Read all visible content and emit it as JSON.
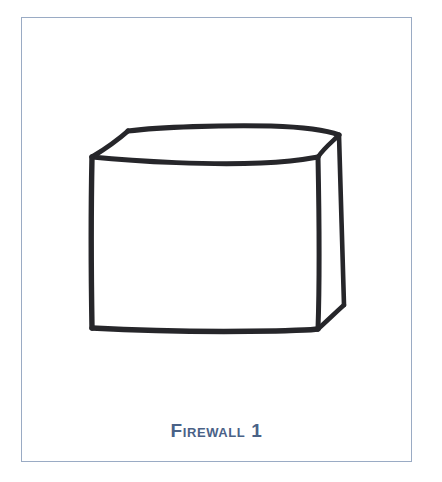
{
  "figure": {
    "caption": "Firewall 1",
    "diagram": {
      "kind": "hand-drawn-box",
      "subject": "firewall appliance",
      "description": "Hand sketched three dimensional rectangular box shown in perspective with visible front face, top face and narrow right side face"
    }
  },
  "colors": {
    "frame_border": "#9aabc4",
    "caption_text": "#4a6287",
    "sketch_ink": "#26262a",
    "page_background": "#ffffff",
    "card_background": "#ffffff"
  }
}
